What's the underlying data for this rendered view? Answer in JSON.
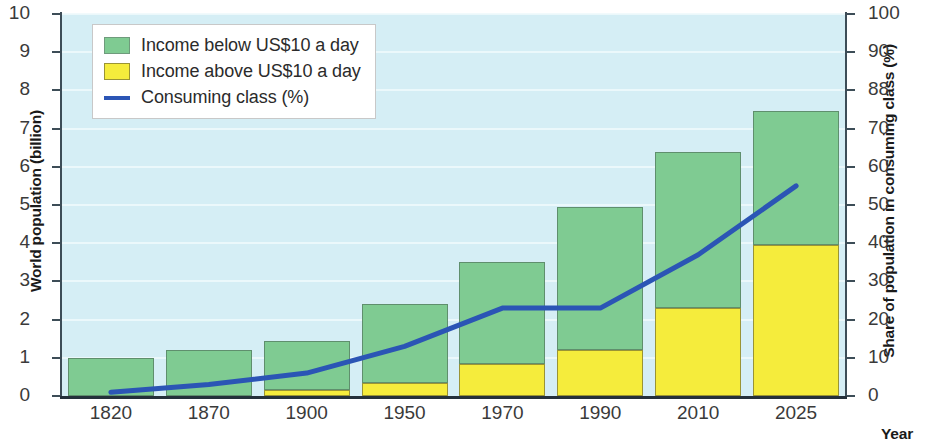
{
  "chart_data": {
    "type": "bar",
    "title": "",
    "subtitle": "",
    "xlabel": "Year",
    "ylabel": "World population (billion)",
    "ylabel_secondary": "Share of population in consuming class (%)",
    "categories": [
      "1820",
      "1870",
      "1900",
      "1950",
      "1970",
      "1990",
      "2010",
      "2025"
    ],
    "ylim": [
      0,
      10
    ],
    "ylim_secondary": [
      0,
      100
    ],
    "yticks": [
      "0",
      "1",
      "2",
      "3",
      "4",
      "5",
      "6",
      "7",
      "8",
      "9",
      "10"
    ],
    "yticks_secondary": [
      "0",
      "10",
      "20",
      "30",
      "40",
      "50",
      "60",
      "70",
      "88",
      "90",
      "100"
    ],
    "grid": true,
    "legend_position": "top-left",
    "series": [
      {
        "name": "Income above US$10 a day",
        "key": "income_above",
        "color": "#f5ec3c",
        "stack_order": "bottom",
        "values": [
          0,
          0,
          0.15,
          0.35,
          0.85,
          1.2,
          2.3,
          3.95
        ]
      },
      {
        "name": "Income below US$10 a day",
        "key": "income_below",
        "color": "#7fcb92",
        "stack_order": "top",
        "values": [
          1.0,
          1.2,
          1.3,
          2.05,
          2.65,
          3.75,
          4.1,
          3.5
        ]
      },
      {
        "name": "Consuming class (%)",
        "key": "consuming_class",
        "color": "#2b55b5",
        "type": "line",
        "axis": "secondary",
        "values": [
          1,
          3,
          6,
          13,
          23,
          23,
          37,
          55
        ]
      }
    ],
    "totals": [
      1.0,
      1.2,
      1.45,
      2.4,
      3.5,
      4.95,
      6.4,
      7.45
    ]
  },
  "legend": {
    "items": [
      {
        "label": "Income below US$10 a day",
        "icon": "green-square-swatch"
      },
      {
        "label": "Income above US$10 a day",
        "icon": "yellow-square-swatch"
      },
      {
        "label": "Consuming class (%)",
        "icon": "blue-line-swatch"
      }
    ]
  }
}
